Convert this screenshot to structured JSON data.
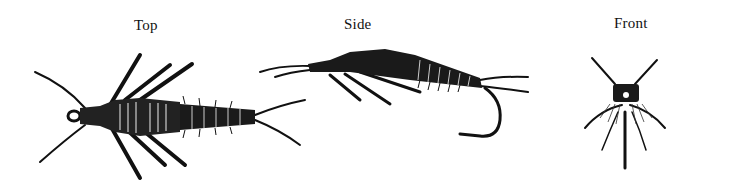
{
  "figure": {
    "views": [
      {
        "id": "top",
        "label": "Top"
      },
      {
        "id": "side",
        "label": "Side"
      },
      {
        "id": "front",
        "label": "Front"
      }
    ]
  },
  "colors": {
    "ink": "#111111",
    "background": "#ffffff"
  }
}
